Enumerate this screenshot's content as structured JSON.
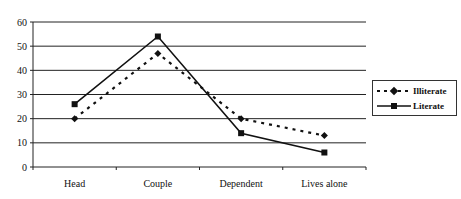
{
  "chart_data": {
    "type": "line",
    "title": "",
    "xlabel": "",
    "ylabel": "",
    "categories": [
      "Head",
      "Couple",
      "Dependent",
      "Lives alone"
    ],
    "series": [
      {
        "name": "Illiterate",
        "values": [
          20,
          47,
          20,
          13
        ],
        "style": "dashed",
        "marker": "diamond"
      },
      {
        "name": "Literate",
        "values": [
          26,
          54,
          14,
          6
        ],
        "style": "solid",
        "marker": "square"
      }
    ],
    "ylim": [
      0,
      60
    ],
    "yticks": [
      0,
      10,
      20,
      30,
      40,
      50,
      60
    ],
    "grid": true,
    "legend_position": "right"
  },
  "legend": {
    "items": [
      {
        "label": "Illiterate"
      },
      {
        "label": "Literate"
      }
    ]
  }
}
